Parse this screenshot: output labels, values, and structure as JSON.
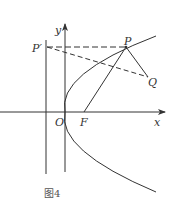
{
  "figure": {
    "caption": "图4",
    "labels": {
      "y_axis": "y",
      "x_axis": "x",
      "origin": "O",
      "focus": "F",
      "point_p": "P",
      "point_p_prime": "P′",
      "point_q": "Q"
    },
    "elements": [
      "parabola opening right with vertex at O",
      "directrix (vertical line left of y-axis)",
      "dashed horizontal segment P′P",
      "dashed segment P′Q",
      "solid segment FP",
      "solid segment PQ"
    ],
    "colors": {
      "stroke": "#333333",
      "background": "#ffffff"
    }
  }
}
